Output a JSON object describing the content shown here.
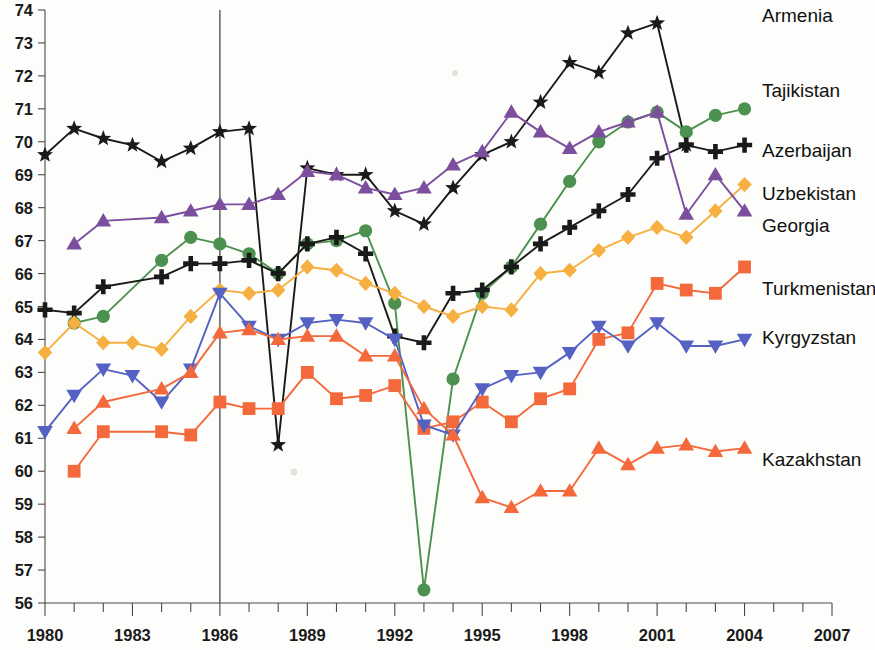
{
  "chart_data": {
    "type": "line",
    "title": "",
    "subtitle": "",
    "xlabel": "",
    "ylabel": "",
    "xlim": [
      1980,
      2007
    ],
    "ylim": [
      56,
      74
    ],
    "grid": false,
    "legend_position": "right-inline-labels",
    "x_tick_labels": [
      "1980",
      "1983",
      "1986",
      "1989",
      "1992",
      "1995",
      "1998",
      "2001",
      "2004",
      "2007"
    ],
    "x_tick_values": [
      1980,
      1983,
      1986,
      1989,
      1992,
      1995,
      1998,
      2001,
      2004,
      2007
    ],
    "x_minor_tick_step": 1,
    "y_tick_labels": [
      "56",
      "57",
      "58",
      "59",
      "60",
      "61",
      "62",
      "63",
      "64",
      "65",
      "66",
      "67",
      "68",
      "69",
      "70",
      "71",
      "72",
      "73",
      "74"
    ],
    "y_tick_values": [
      56,
      57,
      58,
      59,
      60,
      61,
      62,
      63,
      64,
      65,
      66,
      67,
      68,
      69,
      70,
      71,
      72,
      73,
      74
    ],
    "annotations": [
      {
        "name": "reference-line-1986",
        "type": "vline",
        "x": 1986
      }
    ],
    "series": [
      {
        "name": "Armenia",
        "color": "#1a1a1a",
        "marker": "star",
        "label_x": 2004.6,
        "label_y": 73.8,
        "x": [
          1980,
          1981,
          1982,
          1983,
          1984,
          1985,
          1986,
          1987,
          1988,
          1989,
          1990,
          1991,
          1992,
          1993,
          1994,
          1995,
          1996,
          1997,
          1998,
          1999,
          2000,
          2001,
          2002
        ],
        "values": [
          69.6,
          70.4,
          70.1,
          69.9,
          69.4,
          69.8,
          70.3,
          70.4,
          60.8,
          69.2,
          69.0,
          69.0,
          67.9,
          67.5,
          68.6,
          69.6,
          70.0,
          71.2,
          72.4,
          72.1,
          73.3,
          73.6,
          69.9
        ]
      },
      {
        "name": "Tajikistan",
        "color": "#4d9150",
        "marker": "circle",
        "label_x": 2004.6,
        "label_y": 71.5,
        "x": [
          1981,
          1982,
          1984,
          1985,
          1986,
          1987,
          1988,
          1989,
          1990,
          1991,
          1992,
          1993,
          1994,
          1995,
          1996,
          1997,
          1998,
          1999,
          2000,
          2001,
          2002,
          2003,
          2004
        ],
        "values": [
          64.5,
          64.7,
          66.4,
          67.1,
          66.9,
          66.6,
          66.0,
          66.9,
          67.0,
          67.3,
          65.1,
          56.4,
          62.8,
          65.4,
          66.2,
          67.5,
          68.8,
          70.0,
          70.6,
          70.9,
          70.3,
          70.8,
          71.0
        ]
      },
      {
        "name": "Azerbaijan",
        "color": "#1a1a1a",
        "marker": "plus",
        "label_x": 2004.6,
        "label_y": 69.7,
        "x": [
          1980,
          1981,
          1982,
          1984,
          1985,
          1986,
          1987,
          1988,
          1989,
          1990,
          1991,
          1992,
          1993,
          1994,
          1995,
          1996,
          1997,
          1998,
          1999,
          2000,
          2001,
          2002,
          2003,
          2004
        ],
        "values": [
          64.9,
          64.8,
          65.6,
          65.9,
          66.3,
          66.3,
          66.4,
          66.0,
          66.9,
          67.1,
          66.6,
          64.1,
          63.9,
          65.4,
          65.5,
          66.2,
          66.9,
          67.4,
          67.9,
          68.4,
          69.5,
          69.9,
          69.7,
          69.9
        ]
      },
      {
        "name": "Uzbekistan",
        "color": "#f5b041",
        "marker": "diamond",
        "label_x": 2004.6,
        "label_y": 68.4,
        "x": [
          1980,
          1981,
          1982,
          1983,
          1984,
          1985,
          1986,
          1987,
          1988,
          1989,
          1990,
          1991,
          1992,
          1993,
          1994,
          1995,
          1996,
          1997,
          1998,
          1999,
          2000,
          2001,
          2002,
          2003,
          2004
        ],
        "values": [
          63.6,
          64.5,
          63.9,
          63.9,
          63.7,
          64.7,
          65.5,
          65.4,
          65.5,
          66.2,
          66.1,
          65.7,
          65.4,
          65.0,
          64.7,
          65.0,
          64.9,
          66.0,
          66.1,
          66.7,
          67.1,
          67.4,
          67.1,
          67.9,
          68.7
        ]
      },
      {
        "name": "Georgia",
        "color": "#7b4f9d",
        "marker": "triangle-up",
        "label_x": 2004.6,
        "label_y": 67.4,
        "x": [
          1981,
          1982,
          1984,
          1985,
          1986,
          1987,
          1988,
          1989,
          1990,
          1991,
          1992,
          1993,
          1994,
          1995,
          1996,
          1997,
          1998,
          1999,
          2000,
          2001,
          2002,
          2003,
          2004
        ],
        "values": [
          66.9,
          67.6,
          67.7,
          67.9,
          68.1,
          68.1,
          68.4,
          69.1,
          69.0,
          68.6,
          68.4,
          68.6,
          69.3,
          69.7,
          70.9,
          70.3,
          69.8,
          70.3,
          70.6,
          70.9,
          67.8,
          69.0,
          67.9
        ]
      },
      {
        "name": "Turkmenistan",
        "color": "#f4693c",
        "marker": "square",
        "label_x": 2004.6,
        "label_y": 65.5,
        "x": [
          1981,
          1982,
          1984,
          1985,
          1986,
          1987,
          1988,
          1989,
          1990,
          1991,
          1992,
          1993,
          1994,
          1995,
          1996,
          1997,
          1998,
          1999,
          2000,
          2001,
          2002,
          2003,
          2004
        ],
        "values": [
          60.0,
          61.2,
          61.2,
          61.1,
          62.1,
          61.9,
          61.9,
          63.0,
          62.2,
          62.3,
          62.6,
          61.3,
          61.5,
          62.1,
          61.5,
          62.2,
          62.5,
          64.0,
          64.2,
          65.7,
          65.5,
          65.4,
          66.2
        ]
      },
      {
        "name": "Kyrgyzstan",
        "color": "#5562c4",
        "marker": "triangle-down",
        "label_x": 2004.6,
        "label_y": 64.0,
        "x": [
          1980,
          1981,
          1982,
          1983,
          1984,
          1985,
          1986,
          1987,
          1988,
          1989,
          1990,
          1991,
          1992,
          1993,
          1994,
          1995,
          1996,
          1997,
          1998,
          1999,
          2000,
          2001,
          2002,
          2003,
          2004
        ],
        "values": [
          61.2,
          62.3,
          63.1,
          62.9,
          62.1,
          63.1,
          65.4,
          64.4,
          64.0,
          64.5,
          64.6,
          64.5,
          64.0,
          61.4,
          61.1,
          62.5,
          62.9,
          63.0,
          63.6,
          64.4,
          63.8,
          64.5,
          63.8,
          63.8,
          64.0
        ]
      },
      {
        "name": "Kazakhstan",
        "color": "#f4693c",
        "marker": "triangle-up",
        "label_x": 2004.6,
        "label_y": 60.3,
        "x": [
          1981,
          1982,
          1984,
          1985,
          1986,
          1987,
          1988,
          1989,
          1990,
          1991,
          1992,
          1993,
          1994,
          1995,
          1996,
          1997,
          1998,
          1999,
          2000,
          2001,
          2002,
          2003,
          2004
        ],
        "values": [
          61.3,
          62.1,
          62.5,
          63.0,
          64.2,
          64.3,
          64.0,
          64.1,
          64.1,
          63.5,
          63.5,
          61.9,
          61.1,
          59.2,
          58.9,
          59.4,
          59.4,
          60.7,
          60.2,
          60.7,
          60.8,
          60.6,
          60.7
        ]
      }
    ]
  }
}
